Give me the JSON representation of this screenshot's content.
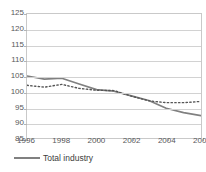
{
  "chart_data": {
    "type": "line",
    "title": "",
    "xlabel": "",
    "ylabel": "",
    "ylim": [
      85,
      125
    ],
    "xlim": [
      1996,
      2006
    ],
    "grid": true,
    "legend_position": "bottom-left",
    "yticks": [
      125,
      120,
      115,
      110,
      105,
      100,
      95,
      90,
      85
    ],
    "xticks": [
      1996,
      1998,
      2000,
      2002,
      2004,
      2006
    ],
    "x": [
      1996,
      1997,
      1998,
      1999,
      2000,
      2001,
      2002,
      2003,
      2004,
      2005,
      2006
    ],
    "series": [
      {
        "name": "Total industry",
        "style": "solid",
        "color": "#808080",
        "values": [
          105.0,
          104.0,
          104.3,
          102.4,
          100.6,
          100.1,
          98.6,
          97.1,
          94.6,
          93.2,
          92.2
        ]
      },
      {
        "name": "",
        "style": "dotted",
        "color": "#555555",
        "values": [
          102.0,
          101.4,
          102.3,
          101.0,
          100.4,
          100.3,
          98.5,
          97.0,
          96.4,
          96.4,
          96.8
        ]
      }
    ]
  },
  "legend": {
    "entries": [
      {
        "label": "Total industry",
        "color": "#808080"
      }
    ]
  },
  "axis": {
    "y_tick_labels": [
      "125",
      "120",
      "115",
      "110",
      "105",
      "100",
      "95",
      "90",
      "85"
    ],
    "x_tick_labels": [
      "1996",
      "1998",
      "2000",
      "2002",
      "2004",
      "2006"
    ]
  },
  "title_remnant": ""
}
